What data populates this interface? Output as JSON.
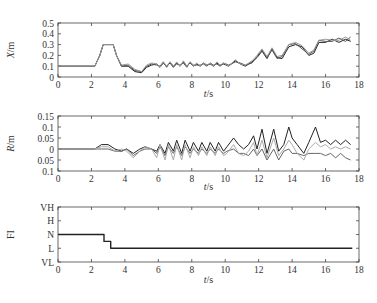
{
  "chart_data": [
    {
      "type": "line",
      "ylabel": "X/m",
      "xlabel": "t/s",
      "xlim": [
        0,
        18
      ],
      "ylim": [
        0,
        0.5
      ],
      "xticks": [
        0,
        2,
        4,
        6,
        8,
        10,
        12,
        14,
        16,
        18
      ],
      "yticks": [
        0,
        0.1,
        0.2,
        0.3,
        0.4,
        0.5
      ],
      "ytick_labels": [
        "0",
        "0.1",
        "0.2",
        "0.3",
        "0.4",
        "0.5"
      ],
      "grid": false,
      "series": [
        {
          "name": "trajectory-1",
          "color": "#222222",
          "x": [
            0,
            2.2,
            2.5,
            2.7,
            3.3,
            3.5,
            3.8,
            4.2,
            4.6,
            5.0,
            5.3,
            5.6,
            5.9,
            6.1,
            6.3,
            6.5,
            6.7,
            6.9,
            7.1,
            7.3,
            7.5,
            7.7,
            7.9,
            8.1,
            8.3,
            8.5,
            8.7,
            8.9,
            9.1,
            9.3,
            9.5,
            9.7,
            9.9,
            10.2,
            10.6,
            10.9,
            11.2,
            11.6,
            11.9,
            12.2,
            12.5,
            12.8,
            13.1,
            13.4,
            13.8,
            14.2,
            14.6,
            15.0,
            15.3,
            15.6,
            16.0,
            16.4,
            16.8,
            17.2,
            17.5
          ],
          "y": [
            0.1,
            0.1,
            0.2,
            0.3,
            0.3,
            0.2,
            0.1,
            0.1,
            0.05,
            0.04,
            0.09,
            0.11,
            0.12,
            0.09,
            0.13,
            0.1,
            0.13,
            0.09,
            0.13,
            0.1,
            0.14,
            0.1,
            0.13,
            0.1,
            0.12,
            0.1,
            0.13,
            0.11,
            0.12,
            0.1,
            0.13,
            0.11,
            0.12,
            0.1,
            0.15,
            0.12,
            0.1,
            0.14,
            0.18,
            0.24,
            0.17,
            0.26,
            0.18,
            0.17,
            0.28,
            0.3,
            0.28,
            0.2,
            0.22,
            0.32,
            0.32,
            0.35,
            0.32,
            0.35,
            0.33
          ]
        },
        {
          "name": "trajectory-2",
          "color": "#555555",
          "x": [
            0,
            2.2,
            2.5,
            2.7,
            3.3,
            3.5,
            3.8,
            4.2,
            4.6,
            5.0,
            5.3,
            5.6,
            5.9,
            6.1,
            6.3,
            6.5,
            6.7,
            6.9,
            7.1,
            7.3,
            7.5,
            7.7,
            7.9,
            8.1,
            8.3,
            8.5,
            8.7,
            8.9,
            9.1,
            9.3,
            9.5,
            9.7,
            9.9,
            10.2,
            10.6,
            10.9,
            11.2,
            11.6,
            11.9,
            12.2,
            12.5,
            12.8,
            13.1,
            13.4,
            13.8,
            14.2,
            14.6,
            15.0,
            15.3,
            15.6,
            16.0,
            16.4,
            16.8,
            17.2,
            17.5
          ],
          "y": [
            0.1,
            0.1,
            0.2,
            0.3,
            0.3,
            0.2,
            0.1,
            0.11,
            0.06,
            0.05,
            0.1,
            0.12,
            0.11,
            0.1,
            0.14,
            0.09,
            0.14,
            0.1,
            0.12,
            0.11,
            0.13,
            0.09,
            0.14,
            0.11,
            0.11,
            0.11,
            0.12,
            0.1,
            0.13,
            0.11,
            0.12,
            0.1,
            0.13,
            0.11,
            0.14,
            0.13,
            0.11,
            0.13,
            0.19,
            0.25,
            0.18,
            0.25,
            0.17,
            0.19,
            0.3,
            0.31,
            0.26,
            0.21,
            0.24,
            0.34,
            0.33,
            0.33,
            0.36,
            0.33,
            0.37
          ]
        },
        {
          "name": "trajectory-3",
          "color": "#999999",
          "x": [
            0,
            2.2,
            2.5,
            2.7,
            3.3,
            3.5,
            3.8,
            4.2,
            4.6,
            5.0,
            5.3,
            5.6,
            5.9,
            6.1,
            6.3,
            6.5,
            6.7,
            6.9,
            7.1,
            7.3,
            7.5,
            7.7,
            7.9,
            8.1,
            8.3,
            8.5,
            8.7,
            8.9,
            9.1,
            9.3,
            9.5,
            9.7,
            9.9,
            10.2,
            10.6,
            10.9,
            11.2,
            11.6,
            11.9,
            12.2,
            12.5,
            12.8,
            13.1,
            13.4,
            13.8,
            14.2,
            14.6,
            15.0,
            15.3,
            15.6,
            16.0,
            16.4,
            16.8,
            17.2,
            17.5
          ],
          "y": [
            0.1,
            0.1,
            0.2,
            0.3,
            0.3,
            0.2,
            0.11,
            0.12,
            0.07,
            0.05,
            0.11,
            0.13,
            0.12,
            0.09,
            0.14,
            0.1,
            0.14,
            0.1,
            0.14,
            0.1,
            0.15,
            0.1,
            0.14,
            0.1,
            0.13,
            0.1,
            0.13,
            0.11,
            0.13,
            0.1,
            0.14,
            0.11,
            0.13,
            0.1,
            0.16,
            0.12,
            0.11,
            0.15,
            0.2,
            0.26,
            0.19,
            0.27,
            0.19,
            0.2,
            0.3,
            0.32,
            0.29,
            0.22,
            0.25,
            0.34,
            0.35,
            0.34,
            0.34,
            0.37,
            0.34
          ]
        }
      ]
    },
    {
      "type": "line",
      "ylabel": "R/m",
      "xlabel": "t/s",
      "xlim": [
        0,
        18
      ],
      "ylim": [
        -0.1,
        0.15
      ],
      "xticks": [
        0,
        2,
        4,
        6,
        8,
        10,
        12,
        14,
        16,
        18
      ],
      "yticks": [
        -0.1,
        -0.05,
        0,
        0.05,
        0.1,
        0.15
      ],
      "ytick_labels": [
        "0.1",
        "0.05",
        "0",
        "0.05",
        "0.1",
        "0.15"
      ],
      "grid": false,
      "series": [
        {
          "name": "error-1",
          "color": "#222222",
          "x": [
            0,
            2.2,
            2.6,
            3.0,
            3.4,
            3.8,
            4.1,
            4.5,
            4.9,
            5.2,
            5.6,
            5.9,
            6.1,
            6.4,
            6.6,
            6.9,
            7.1,
            7.4,
            7.6,
            7.9,
            8.1,
            8.4,
            8.6,
            8.9,
            9.1,
            9.4,
            9.6,
            9.9,
            10.1,
            10.5,
            10.8,
            11.1,
            11.4,
            11.7,
            11.9,
            12.2,
            12.5,
            12.9,
            13.2,
            13.5,
            13.8,
            14.0,
            14.3,
            14.7,
            15.0,
            15.4,
            15.7,
            16.0,
            16.3,
            16.6,
            16.9,
            17.2,
            17.5
          ],
          "y": [
            0,
            0,
            0.02,
            0.02,
            0,
            -0.01,
            0,
            -0.02,
            0,
            0.01,
            0,
            -0.01,
            0.02,
            -0.02,
            0.03,
            -0.01,
            0.04,
            -0.02,
            0.04,
            -0.01,
            0.03,
            -0.01,
            0.03,
            -0.01,
            0.03,
            -0.01,
            0.03,
            -0.01,
            0.01,
            0.05,
            0.02,
            0,
            0.02,
            0.06,
            0,
            0.09,
            -0.02,
            0.09,
            -0.01,
            0.02,
            0.1,
            0.05,
            0.02,
            -0.02,
            0.03,
            0.1,
            0.03,
            0.04,
            0.02,
            0.04,
            0.02,
            0.04,
            0.02
          ]
        },
        {
          "name": "error-2",
          "color": "#666666",
          "x": [
            0,
            2.2,
            2.6,
            3.0,
            3.4,
            3.8,
            4.1,
            4.5,
            4.9,
            5.2,
            5.6,
            5.9,
            6.1,
            6.4,
            6.6,
            6.9,
            7.1,
            7.4,
            7.6,
            7.9,
            8.1,
            8.4,
            8.6,
            8.9,
            9.1,
            9.4,
            9.6,
            9.9,
            10.1,
            10.5,
            10.8,
            11.1,
            11.4,
            11.7,
            11.9,
            12.2,
            12.5,
            12.9,
            13.2,
            13.5,
            13.8,
            14.0,
            14.3,
            14.7,
            15.0,
            15.4,
            15.7,
            16.0,
            16.3,
            16.6,
            16.9,
            17.2,
            17.5
          ],
          "y": [
            0,
            0,
            0,
            0,
            -0.01,
            -0.01,
            0,
            -0.03,
            -0.01,
            0,
            0,
            -0.02,
            0.01,
            -0.03,
            0.01,
            -0.02,
            0.01,
            -0.03,
            0.01,
            -0.02,
            0,
            -0.02,
            0,
            -0.02,
            0,
            -0.02,
            0,
            -0.02,
            -0.01,
            0,
            -0.02,
            -0.02,
            -0.03,
            0,
            -0.03,
            0,
            -0.05,
            0,
            -0.05,
            -0.01,
            0,
            -0.02,
            -0.02,
            -0.03,
            -0.02,
            -0.02,
            -0.02,
            -0.03,
            -0.02,
            -0.04,
            -0.02,
            -0.04,
            -0.05
          ]
        },
        {
          "name": "error-3",
          "color": "#aaaaaa",
          "x": [
            0,
            2.2,
            2.6,
            3.0,
            3.4,
            3.8,
            4.1,
            4.5,
            4.9,
            5.2,
            5.6,
            5.9,
            6.1,
            6.4,
            6.6,
            6.9,
            7.1,
            7.4,
            7.6,
            7.9,
            8.1,
            8.4,
            8.6,
            8.9,
            9.1,
            9.4,
            9.6,
            9.9,
            10.1,
            10.5,
            10.8,
            11.1,
            11.4,
            11.7,
            11.9,
            12.2,
            12.5,
            12.9,
            13.2,
            13.5,
            13.8,
            14.0,
            14.3,
            14.7,
            15.0,
            15.4,
            15.7,
            16.0,
            16.3,
            16.6,
            16.9,
            17.2,
            17.5
          ],
          "y": [
            0,
            0,
            0.01,
            0.01,
            -0.01,
            0,
            -0.01,
            -0.04,
            -0.01,
            0.01,
            0,
            -0.04,
            0.02,
            -0.05,
            0.02,
            -0.05,
            0.02,
            -0.05,
            0.02,
            -0.04,
            0.01,
            -0.03,
            0.01,
            -0.03,
            0.01,
            -0.03,
            0.01,
            -0.03,
            -0.02,
            0.02,
            -0.02,
            -0.03,
            -0.01,
            0.03,
            -0.03,
            0.04,
            -0.04,
            0.05,
            -0.03,
            0,
            0.04,
            0.02,
            -0.02,
            -0.05,
            0,
            0.03,
            0.01,
            0.02,
            0,
            0.01,
            0,
            0.01,
            0
          ]
        }
      ]
    },
    {
      "type": "line",
      "ylabel": "FI",
      "xlabel": "t/s",
      "xlim": [
        0,
        18
      ],
      "ylim": [
        0,
        4
      ],
      "xticks": [
        0,
        2,
        4,
        6,
        8,
        10,
        12,
        14,
        16,
        18
      ],
      "yticks": [
        0,
        1,
        2,
        3,
        4
      ],
      "ytick_labels": [
        "VL",
        "L",
        "N",
        "H",
        "VH"
      ],
      "grid": false,
      "series": [
        {
          "name": "fuzzy-index",
          "color": "#222222",
          "x": [
            0,
            2.75,
            2.75,
            3.15,
            3.15,
            17.6
          ],
          "y": [
            2,
            2,
            1.5,
            1.5,
            1,
            1
          ]
        }
      ]
    }
  ]
}
